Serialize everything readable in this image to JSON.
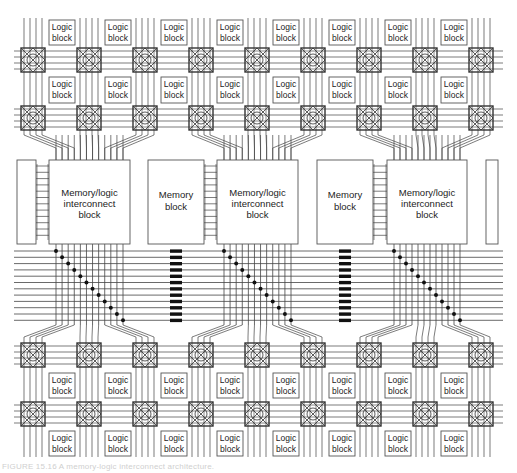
{
  "diagram": {
    "logic_block_label_line1": "Logic",
    "logic_block_label_line2": "block",
    "memory_block_label_line1": "Memory",
    "memory_block_label_line2": "block",
    "mli_label_line1": "Memory/logic",
    "mli_label_line2": "interconnect",
    "mli_label_line3": "block",
    "logic_block_columns": 8,
    "switch_box_columns": 9,
    "logic_block_rows_top": 2,
    "logic_block_rows_bottom": 2,
    "memory_blocks": 2,
    "mli_blocks": 3,
    "horizontal_bus_tracks": 12,
    "mli_vertical_tracks": 12,
    "mli_connection_dots": 12,
    "memory_mli_links": 12,
    "memory_bus_switches": 12,
    "colors": {
      "line": "#444444",
      "box_stroke": "#555555",
      "dot": "#111111",
      "switch_box": "#333333"
    }
  },
  "caption": {
    "text": "FIGURE 15.16 A memory-logic interconnect architecture."
  }
}
